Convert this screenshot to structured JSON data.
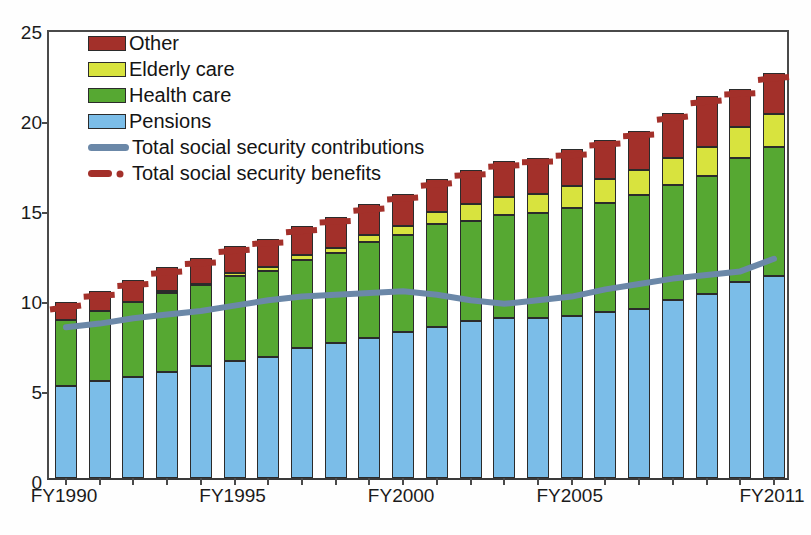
{
  "chart_data": {
    "type": "bar",
    "subtype": "stacked-bar-with-lines",
    "title": "",
    "xlabel": "",
    "ylabel": "",
    "ylim": [
      0,
      25
    ],
    "yticks": [
      0,
      5,
      10,
      15,
      20,
      25
    ],
    "grid": false,
    "legend_position": "top-left",
    "categories": [
      "FY1990",
      "FY1991",
      "FY1992",
      "FY1993",
      "FY1994",
      "FY1995",
      "FY1996",
      "FY1997",
      "FY1998",
      "FY1999",
      "FY2000",
      "FY2001",
      "FY2002",
      "FY2003",
      "FY2004",
      "FY2005",
      "FY2006",
      "FY2007",
      "FY2008",
      "FY2009",
      "FY2010",
      "FY2011"
    ],
    "xtick_labels": [
      "FY1990",
      "FY1995",
      "FY2000",
      "FY2005",
      "FY2011"
    ],
    "series": [
      {
        "name": "Pensions",
        "color": "#7bbde8",
        "values": [
          5.1,
          5.4,
          5.6,
          5.9,
          6.2,
          6.5,
          6.7,
          7.2,
          7.5,
          7.8,
          8.1,
          8.4,
          8.7,
          8.9,
          8.9,
          9.0,
          9.2,
          9.4,
          9.9,
          10.2,
          10.9,
          11.2
        ]
      },
      {
        "name": "Health care",
        "color": "#56a832",
        "values": [
          3.7,
          3.9,
          4.2,
          4.4,
          4.5,
          4.7,
          4.8,
          4.9,
          5.0,
          5.3,
          5.4,
          5.7,
          5.6,
          5.7,
          5.8,
          6.0,
          6.1,
          6.3,
          6.4,
          6.6,
          6.9,
          7.2
        ]
      },
      {
        "name": "Elderly care",
        "color": "#d8e33e",
        "values": [
          0.0,
          0.0,
          0.0,
          0.1,
          0.1,
          0.2,
          0.2,
          0.3,
          0.3,
          0.4,
          0.5,
          0.7,
          0.9,
          1.0,
          1.1,
          1.2,
          1.3,
          1.4,
          1.5,
          1.6,
          1.7,
          1.8
        ]
      },
      {
        "name": "Other",
        "color": "#a3302a",
        "values": [
          1.0,
          1.1,
          1.2,
          1.3,
          1.4,
          1.5,
          1.6,
          1.6,
          1.7,
          1.7,
          1.8,
          1.8,
          1.9,
          2.0,
          2.0,
          2.1,
          2.2,
          2.2,
          2.5,
          2.8,
          2.1,
          2.3
        ]
      }
    ],
    "lines": [
      {
        "name": "Total social security contributions",
        "color": "#6b88a8",
        "style": "solid",
        "values": [
          8.6,
          8.8,
          9.1,
          9.3,
          9.5,
          9.8,
          10.1,
          10.3,
          10.4,
          10.5,
          10.6,
          10.4,
          10.1,
          9.9,
          10.1,
          10.3,
          10.7,
          11.0,
          11.3,
          11.5,
          11.7,
          12.4
        ]
      },
      {
        "name": "Total social security benefits",
        "color": "#a3302a",
        "style": "dashed",
        "values": [
          9.8,
          10.4,
          11.0,
          11.7,
          12.2,
          12.9,
          13.3,
          14.0,
          14.5,
          15.2,
          15.8,
          16.6,
          17.1,
          17.6,
          17.8,
          18.2,
          18.8,
          19.3,
          20.3,
          21.2,
          21.6,
          22.5
        ]
      }
    ]
  },
  "legend": {
    "items": [
      {
        "label": "Other",
        "kind": "swatch",
        "class": "other"
      },
      {
        "label": "Elderly care",
        "kind": "swatch",
        "class": "elderly"
      },
      {
        "label": "Health care",
        "kind": "swatch",
        "class": "health"
      },
      {
        "label": "Pensions",
        "kind": "swatch",
        "class": "pensions"
      },
      {
        "label": "Total social security contributions",
        "kind": "line-solid",
        "class": "contrib"
      },
      {
        "label": "Total social security benefits",
        "kind": "line-dashed",
        "class": "benefit"
      }
    ]
  },
  "axis": {
    "y_labels": [
      "25",
      "20",
      "15",
      "10",
      "5",
      "0"
    ],
    "x_labels": [
      "FY1990",
      "FY1995",
      "FY2000",
      "FY2005",
      "FY2011"
    ]
  }
}
